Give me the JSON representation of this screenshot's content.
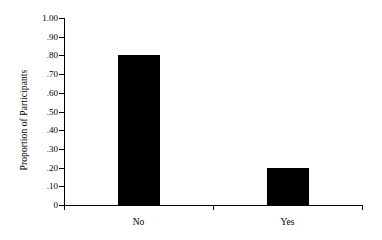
{
  "chart_data": {
    "type": "bar",
    "title": "",
    "subtitle": "",
    "xlabel": "",
    "ylabel": "Proportion of Participants",
    "categories": [
      "No",
      "Yes"
    ],
    "values": [
      0.8,
      0.2
    ],
    "ylim": [
      0,
      1.0
    ],
    "ytick_values": [
      0,
      0.1,
      0.2,
      0.3,
      0.4,
      0.5,
      0.6,
      0.7,
      0.8,
      0.9,
      1.0
    ],
    "ytick_labels": [
      "0",
      ".10",
      ".20",
      ".30",
      ".40",
      ".50",
      ".60",
      ".70",
      ".80",
      ".90",
      "1.00"
    ],
    "grid": false,
    "legend": false,
    "legend_position": "none",
    "bar_color": "#000000",
    "background_color": "#ffffff",
    "axis_color": "#000000"
  },
  "axis": {
    "y_title": "Proportion of Participants",
    "ticks": [
      {
        "label": "1.00",
        "value": 1.0
      },
      {
        "label": ".90",
        "value": 0.9
      },
      {
        "label": ".80",
        "value": 0.8
      },
      {
        "label": ".70",
        "value": 0.7
      },
      {
        "label": ".60",
        "value": 0.6
      },
      {
        "label": ".50",
        "value": 0.5
      },
      {
        "label": ".40",
        "value": 0.4
      },
      {
        "label": ".30",
        "value": 0.3
      },
      {
        "label": ".20",
        "value": 0.2
      },
      {
        "label": ".10",
        "value": 0.1
      },
      {
        "label": "0",
        "value": 0.0
      }
    ],
    "x_categories": [
      {
        "label": "No",
        "value": 0.8
      },
      {
        "label": "Yes",
        "value": 0.2
      }
    ]
  }
}
